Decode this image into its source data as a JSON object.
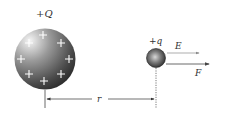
{
  "diagram": {
    "source_charge": {
      "label": "+Q",
      "plus_signs": [
        "+",
        "+",
        "+",
        "+",
        "+",
        "+",
        "+",
        "+"
      ]
    },
    "test_charge": {
      "label": "+q"
    },
    "vectors": [
      {
        "label": "E",
        "color": "#8a8a8a"
      },
      {
        "label": "F",
        "color": "#555555"
      }
    ],
    "distance": {
      "label": "r"
    },
    "colors": {
      "sphere_light": "#f2f2f2",
      "sphere_dark": "#2a2a2a",
      "line": "#444444",
      "text": "#333333"
    }
  }
}
